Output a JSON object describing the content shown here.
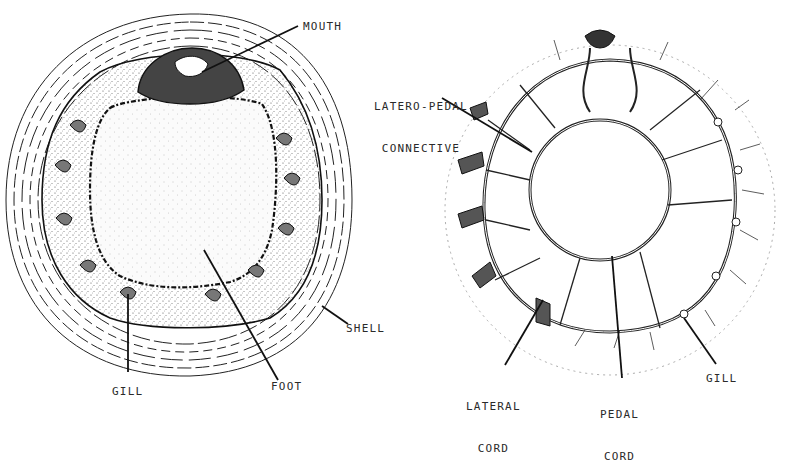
{
  "figure": {
    "left_panel": {
      "name": "ventral-view",
      "labels": {
        "mouth": "MOUTH",
        "shell": "SHELL",
        "gill": "GILL",
        "foot": "FOOT"
      }
    },
    "right_panel": {
      "name": "nervous-system",
      "labels": {
        "latero_pedal_line1": "LATERO-PEDAL",
        "latero_pedal_line2": "CONNECTIVE",
        "lateral_cord_line1": "LATERAL",
        "lateral_cord_line2": "CORD",
        "pedal_cord_line1": "PEDAL",
        "pedal_cord_line2": "CORD",
        "gill": "GILL"
      }
    },
    "colors": {
      "ink": "#1a1a1a",
      "stipple": "#555555",
      "background": "#ffffff"
    }
  }
}
